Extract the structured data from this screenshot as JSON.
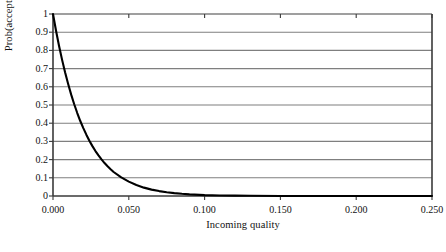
{
  "chart_data": {
    "type": "line",
    "title": "",
    "xlabel": "Incoming quality",
    "ylabel": "Prob(acceptance)",
    "xlim": [
      0.0,
      0.25
    ],
    "ylim": [
      0,
      1
    ],
    "grid": "horizontal",
    "legend": "none",
    "xticks": [
      "0.000",
      "0.050",
      "0.100",
      "0.150",
      "0.200",
      "0.250"
    ],
    "xtick_values": [
      0.0,
      0.05,
      0.1,
      0.15,
      0.2,
      0.25
    ],
    "yticks": [
      "0",
      "0.1",
      "0.2",
      "0.3",
      "0.4",
      "0.5",
      "0.6",
      "0.7",
      "0.8",
      "0.9",
      "1"
    ],
    "ytick_values": [
      0,
      0.1,
      0.2,
      0.3,
      0.4,
      0.5,
      0.6,
      0.7,
      0.8,
      0.9,
      1
    ],
    "series": [
      {
        "name": "Prob(acceptance)",
        "color": "#000000",
        "x": [
          0.0,
          0.002,
          0.004,
          0.006,
          0.008,
          0.01,
          0.012,
          0.014,
          0.016,
          0.018,
          0.02,
          0.022,
          0.024,
          0.026,
          0.028,
          0.03,
          0.032,
          0.034,
          0.036,
          0.038,
          0.04,
          0.045,
          0.05,
          0.055,
          0.06,
          0.065,
          0.07,
          0.075,
          0.08,
          0.085,
          0.09,
          0.1,
          0.11,
          0.12,
          0.13,
          0.15,
          0.175,
          0.2,
          0.225,
          0.25
        ],
        "y": [
          1.0,
          0.908,
          0.824,
          0.748,
          0.678,
          0.615,
          0.557,
          0.504,
          0.456,
          0.412,
          0.373,
          0.337,
          0.304,
          0.274,
          0.247,
          0.223,
          0.201,
          0.181,
          0.163,
          0.147,
          0.132,
          0.102,
          0.079,
          0.06,
          0.046,
          0.035,
          0.027,
          0.021,
          0.016,
          0.012,
          0.009,
          0.005,
          0.003,
          0.002,
          0.001,
          0.0004,
          0.0001,
          4e-05,
          1e-05,
          4e-06
        ]
      }
    ],
    "colors": {
      "curve": "#000000",
      "gridline": "#7f7f7f",
      "axis": "#3a3a3a",
      "background": "#ffffff"
    }
  }
}
